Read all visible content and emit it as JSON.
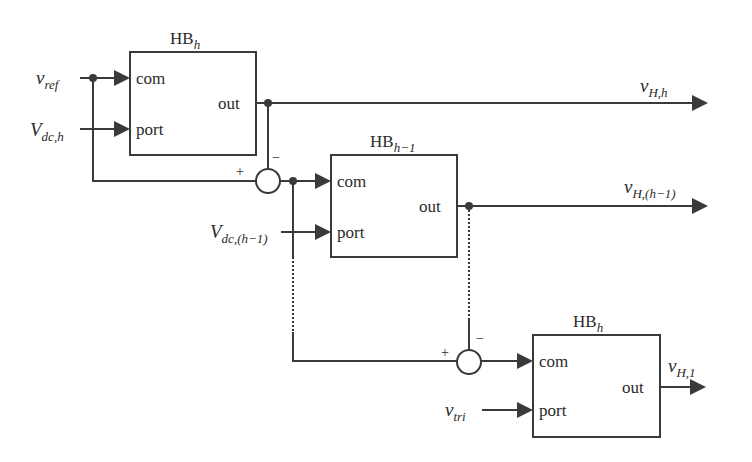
{
  "diagram": {
    "type": "cascaded half-bridge control block diagram",
    "blocks": [
      {
        "id": "hb-top",
        "title_main": "HB",
        "title_sub": "h",
        "ports": {
          "com": "com",
          "port": "port",
          "out": "out"
        }
      },
      {
        "id": "hb-middle",
        "title_main": "HB",
        "title_sub": "h−1",
        "ports": {
          "com": "com",
          "port": "port",
          "out": "out"
        }
      },
      {
        "id": "hb-bottom",
        "title_main": "HB",
        "title_sub": "h",
        "ports": {
          "com": "com",
          "port": "port",
          "out": "out"
        }
      }
    ],
    "inputs": {
      "vref": {
        "main": "v",
        "sub": "ref"
      },
      "vdc_h": {
        "main": "V",
        "sub": "dc,h"
      },
      "vdc_h1": {
        "main": "V",
        "sub": "dc,(h−1)"
      },
      "vtri": {
        "main": "v",
        "sub": "tri"
      }
    },
    "outputs": {
      "vH_h": {
        "main": "v",
        "sub": "H,h"
      },
      "vH_h1": {
        "main": "v",
        "sub": "H,(h−1)"
      },
      "vH_1": {
        "main": "v",
        "sub": "H,1"
      }
    },
    "summers": [
      {
        "id": "sum-1",
        "plus": "+",
        "minus": "−"
      },
      {
        "id": "sum-2",
        "plus": "+",
        "minus": "−"
      }
    ]
  }
}
